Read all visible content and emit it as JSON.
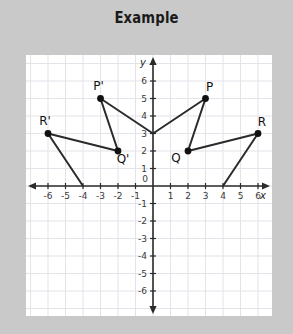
{
  "title": "Example",
  "colors": {
    "page_background": "#c9c9c9",
    "plot_background": "#ffffff",
    "grid": "#e3e3ea",
    "axis": "#2b2b2b",
    "shape_stroke": "#2b2b2b",
    "point_fill": "#111111",
    "title_text": "#1a1a1a",
    "tick_text": "#3a3a3a"
  },
  "chart_data": {
    "type": "scatter",
    "title": "Example",
    "xlabel": "x",
    "ylabel": "y",
    "xlim": [
      -7,
      7
    ],
    "ylim": [
      -7,
      7
    ],
    "grid": true,
    "legend": "none",
    "x_ticks": [
      -6,
      -5,
      -4,
      -3,
      -2,
      -1,
      1,
      2,
      3,
      4,
      5,
      6
    ],
    "y_ticks": [
      -6,
      -5,
      -4,
      -3,
      -2,
      -1,
      1,
      2,
      3,
      4,
      5,
      6
    ],
    "origin_label": "0",
    "x_tick_labels": [
      "-6",
      "-5",
      "-4",
      "-3",
      "-2",
      "-1",
      "1",
      "2",
      "3",
      "4",
      "5",
      "6"
    ],
    "y_tick_labels": [
      "-6",
      "-5",
      "-4",
      "-3",
      "-2",
      "-1",
      "1",
      "2",
      "3",
      "4",
      "5",
      "6"
    ],
    "labeled_points": [
      {
        "name": "P'",
        "x": -3,
        "y": 5,
        "label_dx": -2,
        "label_dy": -9
      },
      {
        "name": "Q'",
        "x": -2,
        "y": 2,
        "label_dx": 5,
        "label_dy": 12
      },
      {
        "name": "R'",
        "x": -6,
        "y": 3,
        "label_dx": -3,
        "label_dy": -9
      },
      {
        "name": "P",
        "x": 3,
        "y": 5,
        "label_dx": 4,
        "label_dy": -8
      },
      {
        "name": "Q",
        "x": 2,
        "y": 2,
        "label_dx": -12,
        "label_dy": 11
      },
      {
        "name": "R",
        "x": 6,
        "y": 3,
        "label_dx": 4,
        "label_dy": -8
      }
    ],
    "polyline_vertices": [
      {
        "x": -4,
        "y": 0
      },
      {
        "x": -6,
        "y": 3
      },
      {
        "x": -2,
        "y": 2
      },
      {
        "x": -3,
        "y": 5
      },
      {
        "x": 0,
        "y": 3
      },
      {
        "x": 3,
        "y": 5
      },
      {
        "x": 2,
        "y": 2
      },
      {
        "x": 6,
        "y": 3
      },
      {
        "x": 4,
        "y": 0
      }
    ],
    "annotation": "Two congruent arrow/crown figures reflected across the y-axis, joined at the vertex (0, 3)."
  }
}
